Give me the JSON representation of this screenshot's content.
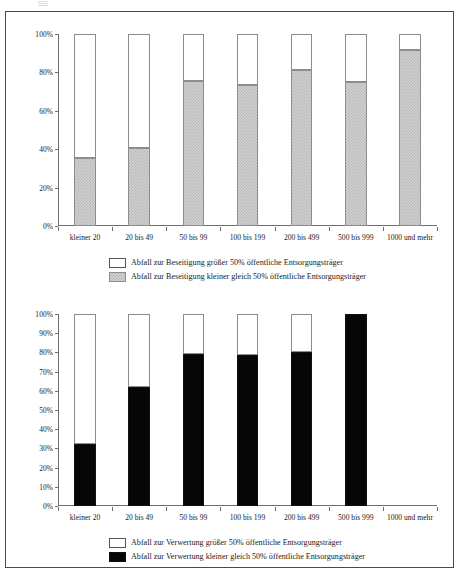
{
  "chart_data": [
    {
      "id": "beseitigung",
      "type": "bar",
      "stacked": true,
      "title": "",
      "xlabel": "",
      "ylabel": "",
      "ylim": [
        0,
        100
      ],
      "ytick_labels": [
        "0%",
        "20%",
        "40%",
        "60%",
        "80%",
        "100%"
      ],
      "ytick_values": [
        0,
        20,
        40,
        60,
        80,
        100
      ],
      "grid": false,
      "legend_position": "bottom",
      "categories": [
        "kleiner 20",
        "20 bis 49",
        "50 bis 99",
        "100 bis 199",
        "200 bis 499",
        "500 bis 999",
        "1000 und mehr"
      ],
      "series": [
        {
          "name": "Abfall zur Beseitigung kleiner gleich 50% öffentliche Entsorgungsträger",
          "color": "#d2d2d2",
          "pattern": "checker",
          "values": [
            35.5,
            40.8,
            75.5,
            73.4,
            81.5,
            75.0,
            91.6
          ]
        },
        {
          "name": "Abfall zur Beseitigung größer 50% öffentliche Entsorgungsträger",
          "color": "#ffffff",
          "pattern": "solid",
          "values": [
            64.5,
            59.2,
            24.5,
            26.6,
            18.5,
            25.0,
            8.4
          ]
        }
      ],
      "legend": [
        {
          "label": "Abfall zur Beseitigung größer 50% öffentliche Entsorgungsträger",
          "swatch": "white"
        },
        {
          "label": "Abfall zur Beseitigung kleiner gleich 50% öffentliche Entsorgungsträger",
          "swatch": "hatch"
        }
      ]
    },
    {
      "id": "verwertung",
      "type": "bar",
      "stacked": true,
      "title": "",
      "xlabel": "",
      "ylabel": "",
      "ylim": [
        0,
        100
      ],
      "ytick_labels": [
        "0%",
        "10%",
        "20%",
        "30%",
        "40%",
        "50%",
        "60%",
        "70%",
        "80%",
        "90%",
        "100%"
      ],
      "ytick_values": [
        0,
        10,
        20,
        30,
        40,
        50,
        60,
        70,
        80,
        90,
        100
      ],
      "grid": false,
      "legend_position": "bottom",
      "categories": [
        "kleiner 20",
        "20 bis 49",
        "50 bis 99",
        "100 bis 199",
        "200 bis 499",
        "500 bis 999",
        "1000 und mehr"
      ],
      "series": [
        {
          "name": "Abfall zur Verwertung kleiner gleich 50% öffentliche Entsorgungsträger",
          "color": "#060606",
          "pattern": "solid",
          "values": [
            32.5,
            62.0,
            79.3,
            78.5,
            80.2,
            100.0,
            null
          ]
        },
        {
          "name": "Abfall zur Verwertung größer 50% öffentliche Entsorgungsträger",
          "color": "#ffffff",
          "pattern": "solid",
          "values": [
            67.5,
            38.0,
            20.7,
            21.5,
            19.8,
            0.0,
            null
          ]
        }
      ],
      "legend": [
        {
          "label": "Abfall zur Verwertung größer 50% öffentliche Entsorgungsträger",
          "swatch": "white"
        },
        {
          "label": "Abfall zur Verwertung kleiner gleich 50% öffentliche Entsorgungsträger",
          "swatch": "black"
        }
      ]
    }
  ]
}
